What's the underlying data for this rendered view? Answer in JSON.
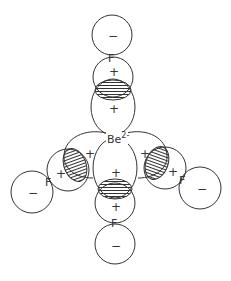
{
  "diagram": {
    "central_atom": {
      "symbol": "Be",
      "charge": "2-"
    },
    "ligands": [
      {
        "position": "top",
        "symbol": "F",
        "outer_lobe_sign": "−",
        "inner_lobe_sign": "+"
      },
      {
        "position": "left",
        "symbol": "F",
        "outer_lobe_sign": "−",
        "inner_lobe_sign": "+"
      },
      {
        "position": "right",
        "symbol": "F",
        "outer_lobe_sign": "−",
        "inner_lobe_sign": "+"
      },
      {
        "position": "bottom",
        "symbol": "F",
        "outer_lobe_sign": "−",
        "inner_lobe_sign": "+"
      }
    ],
    "be_lobes": [
      {
        "position": "top",
        "sign": "+"
      },
      {
        "position": "left",
        "sign": "+"
      },
      {
        "position": "right",
        "sign": "+"
      },
      {
        "position": "bottom",
        "sign": "+"
      }
    ],
    "overlap_regions": [
      "top",
      "left",
      "right",
      "bottom"
    ],
    "colors": {
      "stroke": "#333333",
      "background": "#ffffff"
    }
  }
}
